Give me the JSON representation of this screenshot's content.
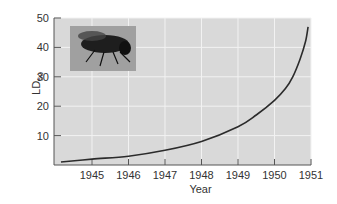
{
  "chart_data": {
    "type": "line",
    "title": "",
    "xlabel": "Year",
    "ylabel": "LD50",
    "ylabel_main": "LD",
    "ylabel_sub": "50",
    "xlim": [
      1944,
      1951
    ],
    "ylim": [
      0,
      50
    ],
    "x_ticks": [
      1945,
      1946,
      1947,
      1948,
      1949,
      1950,
      1951
    ],
    "y_ticks": [
      10,
      20,
      30,
      40,
      50
    ],
    "grid": true,
    "legend": null,
    "inset_image": "housefly-photo",
    "series": [
      {
        "name": "LD50 of DDT for houseflies",
        "x": [
          1944.15,
          1945,
          1946,
          1947,
          1948,
          1949,
          1949.5,
          1950,
          1950.3,
          1950.5,
          1950.7,
          1950.85,
          1950.92
        ],
        "values": [
          1,
          2,
          3,
          5,
          8,
          13,
          17,
          22,
          26,
          30,
          36,
          42,
          47
        ]
      }
    ]
  },
  "colors": {
    "plot_bg": "#d9d9d9",
    "grid": "#f2f2f2",
    "line": "#2b2b2b",
    "axis": "#555555"
  }
}
